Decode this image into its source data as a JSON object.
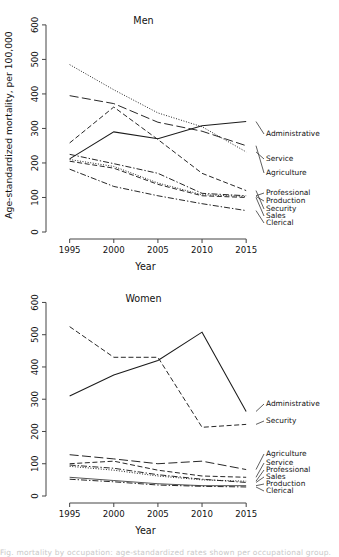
{
  "figure": {
    "axis_y_label": "Age-standardized mortality, per 100,000",
    "axis_x_label": "Year",
    "caption_partial": "Fig. mortality by occupation: age-standardized rates shown per occupational group."
  },
  "chart_data": [
    {
      "type": "line",
      "title": "Men",
      "xlabel": "Year",
      "ylabel": "Age-standardized mortality, per 100,000",
      "x": [
        1995,
        2000,
        2005,
        2010,
        2015
      ],
      "xlim": [
        1993,
        2016
      ],
      "ylim": [
        0,
        620
      ],
      "yticks": [
        0,
        100,
        200,
        300,
        400,
        500,
        600
      ],
      "xticks": [
        1995,
        2000,
        2005,
        2010,
        2015
      ],
      "grid": false,
      "legend_position": "right-inline-labels",
      "series": [
        {
          "name": "Service",
          "values": [
            485,
            412,
            345,
            305,
            232
          ],
          "style": "dotted"
        },
        {
          "name": "Agriculture",
          "values": [
            395,
            372,
            318,
            292,
            250
          ],
          "style": "longdash"
        },
        {
          "name": "Security",
          "values": [
            258,
            362,
            268,
            170,
            120
          ],
          "style": "dash"
        },
        {
          "name": "Administrative",
          "values": [
            212,
            290,
            270,
            308,
            320
          ],
          "style": "solid"
        },
        {
          "name": "Professional",
          "values": [
            225,
            198,
            170,
            112,
            105
          ],
          "style": "dashdot"
        },
        {
          "name": "Production",
          "values": [
            210,
            190,
            142,
            108,
            103
          ],
          "style": "dotted"
        },
        {
          "name": "Sales",
          "values": [
            205,
            185,
            138,
            105,
            100
          ],
          "style": "dash"
        },
        {
          "name": "Clerical",
          "values": [
            182,
            132,
            105,
            82,
            62
          ],
          "style": "dashdot"
        }
      ]
    },
    {
      "type": "line",
      "title": "Women",
      "xlabel": "Year",
      "ylabel": "Age-standardized mortality, per 100,000",
      "x": [
        1995,
        2000,
        2005,
        2010,
        2015
      ],
      "xlim": [
        1993,
        2016
      ],
      "ylim": [
        0,
        620
      ],
      "yticks": [
        0,
        100,
        200,
        300,
        400,
        500,
        600
      ],
      "xticks": [
        1995,
        2000,
        2005,
        2010,
        2015
      ],
      "grid": false,
      "legend_position": "right-inline-labels",
      "series": [
        {
          "name": "Security",
          "values": [
            525,
            430,
            430,
            213,
            222
          ],
          "style": "dash"
        },
        {
          "name": "Administrative",
          "values": [
            310,
            375,
            420,
            508,
            262
          ],
          "style": "solid"
        },
        {
          "name": "Agriculture",
          "values": [
            128,
            115,
            100,
            108,
            82
          ],
          "style": "longdash"
        },
        {
          "name": "Service",
          "values": [
            100,
            108,
            80,
            62,
            58
          ],
          "style": "dash"
        },
        {
          "name": "Professional",
          "values": [
            92,
            80,
            62,
            50,
            46
          ],
          "style": "dotted"
        },
        {
          "name": "Sales",
          "values": [
            96,
            86,
            66,
            52,
            42
          ],
          "style": "dashdot"
        },
        {
          "name": "Production",
          "values": [
            58,
            48,
            38,
            32,
            32
          ],
          "style": "solid-thin"
        },
        {
          "name": "Clerical",
          "values": [
            52,
            44,
            34,
            30,
            28
          ],
          "style": "dashdot"
        }
      ]
    }
  ],
  "men_labels": [
    {
      "text": "Administrative",
      "value": 320
    },
    {
      "text": "Service",
      "value": 232
    },
    {
      "text": "Agriculture",
      "value": 250
    },
    {
      "text": "Professional",
      "value": 105
    },
    {
      "text": "Production",
      "value": 103
    },
    {
      "text": "Security",
      "value": 120
    },
    {
      "text": "Sales",
      "value": 100
    },
    {
      "text": "Clerical",
      "value": 62
    }
  ],
  "women_labels": [
    {
      "text": "Administrative",
      "value": 262
    },
    {
      "text": "Security",
      "value": 222
    },
    {
      "text": "Agriculture",
      "value": 82
    },
    {
      "text": "Service",
      "value": 58
    },
    {
      "text": "Professional",
      "value": 46
    },
    {
      "text": "Sales",
      "value": 42
    },
    {
      "text": "Production",
      "value": 32
    },
    {
      "text": "Clerical",
      "value": 28
    }
  ]
}
